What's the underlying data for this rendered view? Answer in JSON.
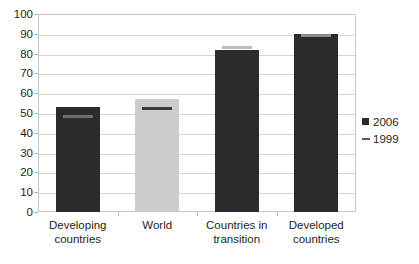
{
  "chart_data": {
    "type": "bar",
    "title": "",
    "subtitle": "",
    "xlabel": "",
    "ylabel": "",
    "ylim": [
      0,
      100
    ],
    "ytick_step": 10,
    "ytick_labels": [
      "100",
      "90",
      "80",
      "70",
      "60",
      "50",
      "40",
      "30",
      "20",
      "10",
      "0"
    ],
    "ytick_values": [
      100,
      90,
      80,
      70,
      60,
      50,
      40,
      30,
      20,
      10,
      0
    ],
    "grid": true,
    "legend_position": "right",
    "categories": [
      "Developing countries",
      "World",
      "Countries in transition",
      "Developed countries"
    ],
    "category_lines": [
      [
        "Developing",
        "countries"
      ],
      [
        "World",
        ""
      ],
      [
        "Countries in",
        "transition"
      ],
      [
        "Developed",
        "countries"
      ]
    ],
    "series": [
      {
        "name": "2006",
        "render": "bar",
        "values": [
          53,
          57,
          82,
          90
        ],
        "colors": [
          "#2b2b2b",
          "#cccccc",
          "#2b2b2b",
          "#2b2b2b"
        ]
      },
      {
        "name": "1999",
        "render": "dash-marker",
        "values": [
          48,
          52,
          83,
          89
        ],
        "colors": [
          "#6e6e6e",
          "#3a3a3a",
          "#bdbdbd",
          "#8a8a8a"
        ]
      }
    ]
  },
  "legend": {
    "entries": [
      {
        "label": "2006",
        "marker": "filled-square",
        "color": "#2b2b2b"
      },
      {
        "label": "1999",
        "marker": "dash",
        "color": "#5a5a5a"
      }
    ]
  },
  "colors": {
    "bar_dark": "#2b2b2b",
    "bar_light": "#cccccc",
    "gridline": "#d4d4d4",
    "frame_border": "#c9c9c9",
    "text": "#231f20",
    "background": "#ffffff"
  }
}
